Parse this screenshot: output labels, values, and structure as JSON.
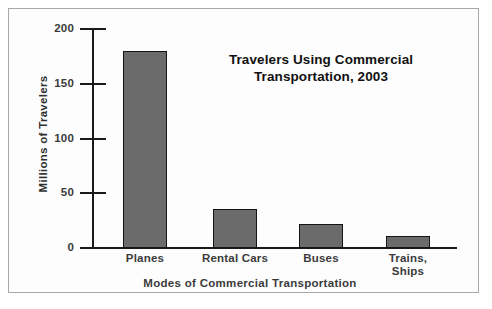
{
  "chart_data": {
    "type": "bar",
    "title": "Travelers Using Commercial Transportation, 2003",
    "title_line1": "Travelers Using Commercial",
    "title_line2": "Transportation, 2003",
    "xlabel": "Modes of Commercial Transportation",
    "ylabel": "Millions of Travelers",
    "categories": [
      "Planes",
      "Rental Cars",
      "Buses",
      "Trains, Ships"
    ],
    "category_labels": [
      {
        "line1": "Planes",
        "line2": ""
      },
      {
        "line1": "Rental Cars",
        "line2": ""
      },
      {
        "line1": "Buses",
        "line2": ""
      },
      {
        "line1": "Trains,",
        "line2": "Ships"
      }
    ],
    "values": [
      180,
      36,
      22,
      11
    ],
    "ylim": [
      0,
      200
    ],
    "yticks": [
      0,
      50,
      100,
      150,
      200
    ],
    "ytick_labels": [
      "0",
      "50",
      "100",
      "150",
      "200"
    ],
    "grid": false,
    "legend": false,
    "bar_color": "#6b6b6b",
    "bar_edge_color": "#141414",
    "background_color": "#fdfdfd",
    "frame_color": "#a8a8a8"
  }
}
